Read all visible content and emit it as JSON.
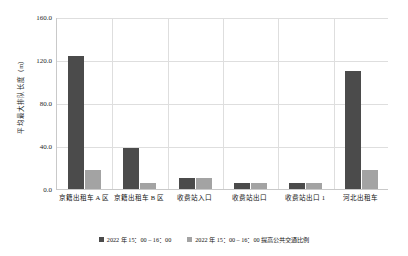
{
  "chart_data": {
    "type": "bar",
    "title": "",
    "xlabel": "",
    "ylabel": "平均最大排队长度（m）",
    "ylim": [
      0,
      160
    ],
    "yticks": [
      "0.0",
      "40.0",
      "80.0",
      "120.0",
      "160.0"
    ],
    "ytick_values": [
      0,
      40,
      80,
      120,
      160
    ],
    "grid": true,
    "legend_position": "bottom",
    "categories": [
      "京籍出租车 A 区",
      "京籍出租车 B 区",
      "收费站入口",
      "收费站出口",
      "收费站出口 1",
      "河北出租车"
    ],
    "series": [
      {
        "name": "2022 年 15：00 – 16：00",
        "color": "#4b4b4b",
        "values": [
          124,
          38,
          10,
          6,
          6,
          110
        ]
      },
      {
        "name": "2022 年 15：00 – 16：00 提高公共交通比例",
        "color": "#a3a3a3",
        "values": [
          18,
          6,
          10,
          6,
          6,
          18
        ]
      }
    ]
  }
}
